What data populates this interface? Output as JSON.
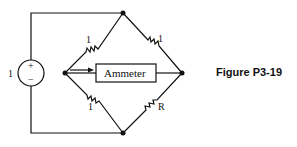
{
  "figure": {
    "caption": "Figure P3-19"
  },
  "circuit": {
    "source": {
      "label": "1",
      "plus": "+",
      "minus": "−"
    },
    "resistors": {
      "top_left": "1",
      "top_right": "1",
      "bottom_left": "1",
      "bottom_right": "R"
    },
    "meter": {
      "label": "Ammeter"
    }
  },
  "colors": {
    "stroke": "#111111",
    "background": "#ffffff"
  }
}
